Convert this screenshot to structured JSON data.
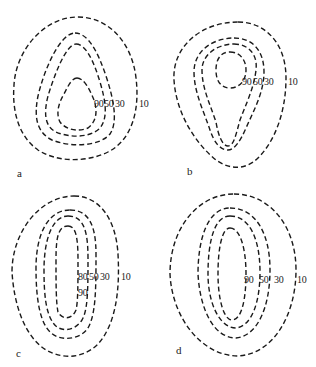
{
  "figure": {
    "type": "contour-diagram",
    "line_style": "dashed",
    "line_color": "#1a1a1a",
    "panels": [
      {
        "id": "a",
        "letter": "a",
        "labels": [
          "90",
          "50",
          "30",
          "10"
        ]
      },
      {
        "id": "b",
        "letter": "b",
        "labels": [
          "90",
          "50",
          "30",
          "10"
        ]
      },
      {
        "id": "c",
        "letter": "c",
        "labels": [
          "80",
          "50",
          "30",
          "10",
          "90"
        ]
      },
      {
        "id": "d",
        "letter": "d",
        "labels": [
          "90",
          "50",
          "30",
          "10"
        ]
      }
    ]
  }
}
